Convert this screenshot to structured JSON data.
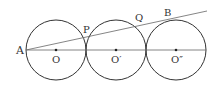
{
  "diagram": {
    "type": "geometry",
    "colors": {
      "stroke": "#333333",
      "line": "#666666",
      "background": "#ffffff"
    },
    "circles": [
      {
        "name": "O",
        "cx": 56,
        "cy": 50,
        "r": 30
      },
      {
        "name": "O'",
        "cx": 116,
        "cy": 50,
        "r": 30
      },
      {
        "name": "O''",
        "cx": 176,
        "cy": 50,
        "r": 30
      }
    ],
    "lines": [
      {
        "name": "diameter-line",
        "x1": 26,
        "y1": 50,
        "x2": 206,
        "y2": 50
      },
      {
        "name": "tangent-line-AB",
        "x1": 26,
        "y1": 50,
        "x2": 207,
        "y2": 11
      }
    ],
    "labels": {
      "A": "A",
      "P": "P",
      "Q": "Q",
      "B": "B",
      "O": "O",
      "O1": "O′",
      "O2": "O″"
    }
  }
}
